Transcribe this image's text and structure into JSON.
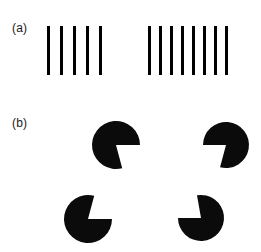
{
  "figure": {
    "background_color": "#ffffff",
    "ink_color": "#000000",
    "width": 261,
    "height": 252,
    "panels": [
      {
        "id": "a",
        "label": "(a)",
        "description": "two groups of vertical black bars differing in number and spacing",
        "label_x": 12,
        "label_y": 22,
        "bar_groups": [
          {
            "name": "left-bar-group",
            "count": 5,
            "bar_width": 3,
            "bar_height": 49,
            "spacing": 13,
            "x": 47,
            "y": 26
          },
          {
            "name": "right-bar-group",
            "count": 8,
            "bar_width": 3,
            "bar_height": 49,
            "spacing": 11,
            "x": 148,
            "y": 26
          }
        ]
      },
      {
        "id": "b",
        "label": "(b)",
        "description": "four pac-man discs with wedges facing inward forming an illusory square",
        "label_x": 12,
        "label_y": 117,
        "discs": [
          {
            "name": "pacman-disc-top-left",
            "cx": 116,
            "cy": 145,
            "r": 24,
            "wedge_start_deg": 0,
            "wedge_end_deg": 75
          },
          {
            "name": "pacman-disc-top-right",
            "cx": 226,
            "cy": 145,
            "r": 23,
            "wedge_start_deg": 105,
            "wedge_end_deg": 180
          },
          {
            "name": "pacman-disc-bottom-left",
            "cx": 88,
            "cy": 219,
            "r": 24,
            "wedge_start_deg": 285,
            "wedge_end_deg": 360
          },
          {
            "name": "pacman-disc-bottom-right",
            "cx": 201,
            "cy": 218,
            "r": 23,
            "wedge_start_deg": 180,
            "wedge_end_deg": 260
          }
        ]
      }
    ]
  }
}
